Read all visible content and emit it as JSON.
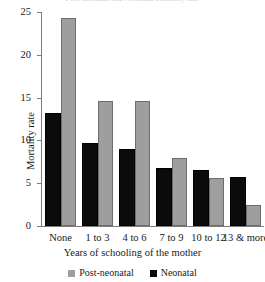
{
  "chart_data": {
    "type": "bar",
    "title": "",
    "xlabel": "Years of schooling of the mother",
    "ylabel": "Mortality rate",
    "ylim": [
      0,
      25
    ],
    "yticks": [
      0,
      5,
      10,
      15,
      20,
      25
    ],
    "grid": false,
    "legend_position": "bottom",
    "categories": [
      "None",
      "1 to 3",
      "4 to 6",
      "7 to 9",
      "10 to 12",
      "13 & more"
    ],
    "series": [
      {
        "name": "Post-neonatal",
        "color": "#9e9e9e",
        "values": [
          24.3,
          14.6,
          14.6,
          8.0,
          5.6,
          2.5
        ]
      },
      {
        "name": "Neonatal",
        "color": "#0b0b0b",
        "values": [
          13.2,
          9.7,
          9.0,
          6.8,
          6.6,
          5.7
        ]
      }
    ]
  },
  "axis": {
    "y_title": "Mortality rate",
    "x_title": "Years of schooling of the mother",
    "tick_labels": [
      "25",
      "20",
      "15",
      "10",
      "5",
      "0"
    ]
  },
  "legend": {
    "items": [
      {
        "label": "Post-neonatal",
        "swatch": "gray"
      },
      {
        "label": "Neonatal",
        "swatch": "black"
      }
    ]
  },
  "cropped_title": {
    "text": "Post-neonatal and Neonatal mortality rate"
  }
}
